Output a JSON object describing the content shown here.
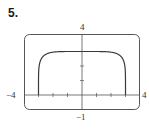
{
  "problem": {
    "number": "5."
  },
  "chart_data": {
    "type": "line",
    "title": "",
    "xlabel": "",
    "ylabel": "",
    "xlim": [
      -4,
      4
    ],
    "ylim": [
      -1,
      4
    ],
    "grid": false,
    "legend": null,
    "axis_labels": {
      "x_min": "−4",
      "x_max": "4",
      "y_min": "−1",
      "y_max": "4"
    },
    "x_ticks": [
      -3,
      -2,
      -1,
      1,
      2,
      3
    ],
    "y_ticks": [
      1,
      2,
      3
    ],
    "series": [
      {
        "name": "curve",
        "description": "Flat-topped curve with vertical sides at x = -3 and x = 3, plateau at y = 3",
        "x": [
          -3,
          -3,
          -2.98,
          -2.9,
          -2.75,
          -2.5,
          -2,
          -1,
          0,
          1,
          2,
          2.5,
          2.75,
          2.9,
          2.98,
          3,
          3
        ],
        "y": [
          0,
          1.2,
          1.8,
          2.3,
          2.6,
          2.8,
          2.95,
          3.0,
          3.0,
          3.0,
          2.95,
          2.8,
          2.6,
          2.3,
          1.8,
          1.2,
          0
        ]
      }
    ],
    "colors": {
      "curve": "#3a3a3a",
      "axes": "#555555",
      "frame": "#555555"
    }
  }
}
